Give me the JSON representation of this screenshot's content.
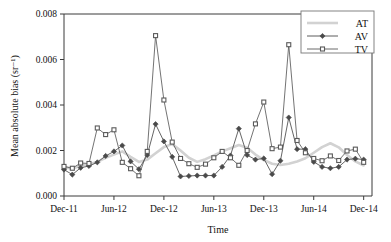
{
  "chart_data": {
    "type": "line",
    "title": "",
    "xlabel": "Time",
    "ylabel": "Mean absolute bias (sr⁻¹)",
    "xlim": [
      0,
      37
    ],
    "ylim": [
      0.0,
      0.008
    ],
    "grid": false,
    "legend_position": "top-right",
    "x_tick_labels": [
      "Dec-11",
      "Jun-12",
      "Dec-12",
      "Jun-13",
      "Dec-13",
      "Jun-14",
      "Dec-14"
    ],
    "x_tick_values": [
      0,
      6,
      12,
      18,
      24,
      30,
      36
    ],
    "y_tick_labels": [
      "0.000",
      "0.002",
      "0.004",
      "0.006",
      "0.008"
    ],
    "y_tick_values": [
      0.0,
      0.002,
      0.004,
      0.006,
      0.008
    ],
    "x": [
      0,
      1,
      2,
      3,
      4,
      5,
      6,
      7,
      8,
      9,
      10,
      11,
      12,
      13,
      14,
      15,
      16,
      17,
      18,
      19,
      20,
      21,
      22,
      23,
      24,
      25,
      26,
      27,
      28,
      29,
      30,
      31,
      32,
      33,
      34,
      35,
      36
    ],
    "series": [
      {
        "name": "AT",
        "color": "#d2d2d2",
        "marker": "none",
        "values": [
          0.00128,
          0.0012,
          0.00134,
          0.0014,
          0.0015,
          0.00168,
          0.00182,
          0.00196,
          0.00172,
          0.0015,
          0.0016,
          0.00188,
          0.00215,
          0.00228,
          0.002,
          0.00168,
          0.0015,
          0.00162,
          0.00178,
          0.00196,
          0.0021,
          0.00224,
          0.00212,
          0.00182,
          0.00158,
          0.00142,
          0.00136,
          0.00142,
          0.00152,
          0.00166,
          0.0019,
          0.00215,
          0.00232,
          0.00214,
          0.0018,
          0.00152,
          0.00134
        ]
      },
      {
        "name": "AV",
        "color": "#4a4a4a",
        "marker": "diamond",
        "values": [
          0.00116,
          0.00094,
          0.00124,
          0.00132,
          0.00148,
          0.00176,
          0.00196,
          0.00222,
          0.00152,
          0.00118,
          0.0018,
          0.00316,
          0.0024,
          0.00172,
          0.00086,
          0.00088,
          0.0009,
          0.0009,
          0.0009,
          0.00128,
          0.00178,
          0.00296,
          0.0018,
          0.0016,
          0.00165,
          0.00096,
          0.00155,
          0.00345,
          0.00206,
          0.00206,
          0.0015,
          0.00128,
          0.00122,
          0.00128,
          0.0016,
          0.00164,
          0.0016
        ]
      },
      {
        "name": "TV",
        "color": "#5a5a5a",
        "marker": "square",
        "values": [
          0.0013,
          0.00122,
          0.00145,
          0.00143,
          0.00299,
          0.0027,
          0.00291,
          0.00148,
          0.0012,
          0.00089,
          0.00196,
          0.00705,
          0.00422,
          0.00237,
          0.00165,
          0.00142,
          0.00126,
          0.0014,
          0.00168,
          0.00196,
          0.00168,
          0.00135,
          0.002,
          0.00317,
          0.00413,
          0.00208,
          0.00215,
          0.00665,
          0.00244,
          0.0019,
          0.00165,
          0.00155,
          0.00176,
          0.00156,
          0.00198,
          0.00206,
          0.00148
        ]
      }
    ]
  },
  "legend": {
    "entries": [
      {
        "label": "AT"
      },
      {
        "label": "AV"
      },
      {
        "label": "TV"
      }
    ]
  }
}
